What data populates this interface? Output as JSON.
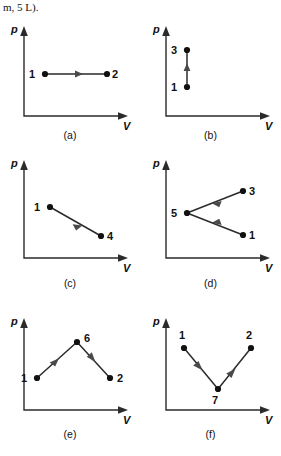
{
  "page": {
    "fragment_text": "m, 5 L).",
    "background_color": "#ffffff",
    "ink_color": "#2b2b2b",
    "label_color": "#111111"
  },
  "axes": {
    "pressure_label": "p",
    "volume_label": "V"
  },
  "panels": [
    {
      "id": "a",
      "caption": "(a)",
      "description": "Isobaric expansion: horizontal line at constant pressure from state 1 to state 2",
      "states": [
        {
          "label": "1",
          "x": 45,
          "y": 62,
          "label_dx": -13,
          "label_dy": 4
        },
        {
          "label": "2",
          "x": 107,
          "y": 62,
          "label_dx": 8,
          "label_dy": 4
        }
      ],
      "processes": [
        {
          "from": "1",
          "to": "2",
          "arrow_at": 0.55,
          "arrow_direction": "right"
        }
      ]
    },
    {
      "id": "b",
      "caption": "(b)",
      "description": "Isochoric pressure increase: vertical line at constant volume from state 1 up to state 3",
      "states": [
        {
          "label": "3",
          "x": 47,
          "y": 38,
          "label_dx": -13,
          "label_dy": 4
        },
        {
          "label": "1",
          "x": 47,
          "y": 75,
          "label_dx": -13,
          "label_dy": 4
        }
      ],
      "processes": [
        {
          "from": "1",
          "to": "3",
          "arrow_at": 0.55,
          "arrow_direction": "up"
        }
      ]
    },
    {
      "id": "c",
      "caption": "(c)",
      "description": "Expansion with falling pressure: descending line from state 1 to state 4",
      "states": [
        {
          "label": "1",
          "x": 50,
          "y": 62,
          "label_dx": -13,
          "label_dy": 4
        },
        {
          "label": "4",
          "x": 101,
          "y": 91,
          "label_dx": 8,
          "label_dy": 4
        }
      ],
      "processes": [
        {
          "from": "1",
          "to": "4",
          "arrow_at": 0.58,
          "arrow_direction": "down-right"
        }
      ]
    },
    {
      "id": "d",
      "caption": "(d)",
      "description": "Two processes converging on state 5: from state 3 down-left to 5, and from state 1 up-left to 5",
      "states": [
        {
          "label": "5",
          "x": 47,
          "y": 68,
          "label_dx": -13,
          "label_dy": 4
        },
        {
          "label": "3",
          "x": 103,
          "y": 46,
          "label_dx": 8,
          "label_dy": 4
        },
        {
          "label": "1",
          "x": 103,
          "y": 90,
          "label_dx": 8,
          "label_dy": 4
        }
      ],
      "processes": [
        {
          "from": "3",
          "to": "5",
          "arrow_at": 0.45,
          "arrow_direction": "left-down"
        },
        {
          "from": "1",
          "to": "5",
          "arrow_at": 0.45,
          "arrow_direction": "left-up"
        }
      ]
    },
    {
      "id": "e",
      "caption": "(e)",
      "description": "Two-step path: state 1 rises to state 6, then falls to state 2 forming an inverted V",
      "states": [
        {
          "label": "1",
          "x": 37,
          "y": 83,
          "label_dx": -13,
          "label_dy": 4
        },
        {
          "label": "6",
          "x": 77,
          "y": 47,
          "label_dx": 8,
          "label_dy": 0
        },
        {
          "label": "2",
          "x": 110,
          "y": 83,
          "label_dx": 8,
          "label_dy": 4
        }
      ],
      "processes": [
        {
          "from": "1",
          "to": "6",
          "arrow_at": 0.55,
          "arrow_direction": "up-right"
        },
        {
          "from": "6",
          "to": "2",
          "arrow_at": 0.55,
          "arrow_direction": "down-right"
        }
      ]
    },
    {
      "id": "f",
      "caption": "(f)",
      "description": "Two-step path: state 1 falls to state 7, then rises to state 2 forming a V",
      "states": [
        {
          "label": "1",
          "x": 44,
          "y": 53,
          "label_dx": -2,
          "label_dy": -9
        },
        {
          "label": "7",
          "x": 78,
          "y": 94,
          "label_dx": -3,
          "label_dy": 15
        },
        {
          "label": "2",
          "x": 111,
          "y": 53,
          "label_dx": -2,
          "label_dy": -9
        }
      ],
      "processes": [
        {
          "from": "1",
          "to": "7",
          "arrow_at": 0.52,
          "arrow_direction": "down-right"
        },
        {
          "from": "7",
          "to": "2",
          "arrow_at": 0.52,
          "arrow_direction": "up-right"
        }
      ]
    }
  ]
}
